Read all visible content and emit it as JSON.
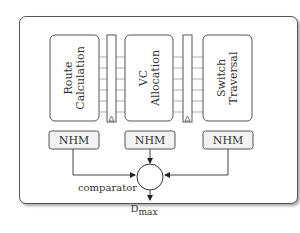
{
  "diagram": {
    "stages": [
      {
        "id": "route",
        "line1": "Route",
        "line2": "Calculation"
      },
      {
        "id": "vc",
        "line1": "VC",
        "line2": "Allocation"
      },
      {
        "id": "switch",
        "line1": "Switch",
        "line2": "Traversal"
      }
    ],
    "monitors": [
      {
        "label": "NHM"
      },
      {
        "label": "NHM"
      },
      {
        "label": "NHM"
      }
    ],
    "comparator_label": "comparator",
    "output": {
      "main": "D",
      "subscript": "max"
    },
    "colors": {
      "stroke": "#555555",
      "box_fill": "#ffffff",
      "nhm_fill": "#f2f2f2",
      "buffer_line": "#999999"
    }
  }
}
